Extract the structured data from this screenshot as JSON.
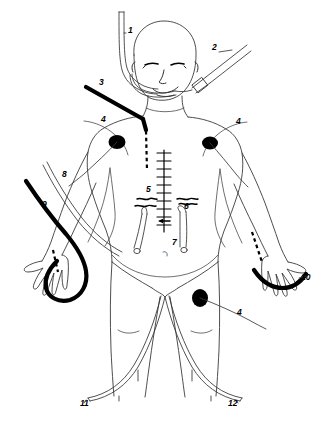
{
  "figure": {
    "background_color": "#ffffff",
    "line_color": "#333333",
    "accent_color": "#000000",
    "label_count": 12
  },
  "labels": [
    {
      "id": "1",
      "text": "1",
      "x": 128,
      "y": 33,
      "refers_to": "ventilator-circuit-tube"
    },
    {
      "id": "2",
      "text": "2",
      "x": 212,
      "y": 50,
      "refers_to": "endotracheal-tube"
    },
    {
      "id": "3",
      "text": "3",
      "x": 99,
      "y": 85,
      "refers_to": "neck-central-venous-line"
    },
    {
      "id": "4a",
      "text": "4",
      "x": 101,
      "y": 122,
      "refers_to": "ecg-electrode-left-chest"
    },
    {
      "id": "4b",
      "text": "4",
      "x": 236,
      "y": 124,
      "refers_to": "ecg-electrode-right-chest"
    },
    {
      "id": "4c",
      "text": "4",
      "x": 237,
      "y": 315,
      "refers_to": "ecg-electrode-right-thigh"
    },
    {
      "id": "5",
      "text": "5",
      "x": 146,
      "y": 192,
      "refers_to": "chest-wound-left"
    },
    {
      "id": "6",
      "text": "6",
      "x": 184,
      "y": 209,
      "refers_to": "chest-wound-right"
    },
    {
      "id": "7",
      "text": "7",
      "x": 172,
      "y": 245,
      "refers_to": "mediastinal-drain"
    },
    {
      "id": "8",
      "text": "8",
      "x": 62,
      "y": 177,
      "refers_to": "left-arm-infusion-line"
    },
    {
      "id": "9",
      "text": "9",
      "x": 42,
      "y": 207,
      "refers_to": "left-arm-second-line"
    },
    {
      "id": "10",
      "text": "10",
      "x": 301,
      "y": 280,
      "refers_to": "right-hand-peripheral-line"
    },
    {
      "id": "11",
      "text": "11",
      "x": 80,
      "y": 406,
      "refers_to": "femoral-catheter-left"
    },
    {
      "id": "12",
      "text": "12",
      "x": 228,
      "y": 406,
      "refers_to": "femoral-catheter-right"
    }
  ]
}
